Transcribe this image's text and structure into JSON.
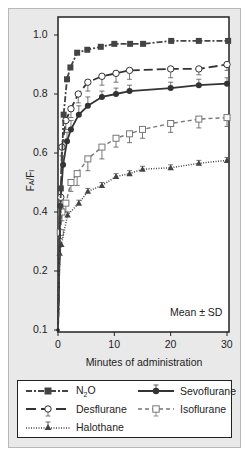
{
  "chart_data": {
    "type": "line",
    "title": "",
    "xlabel": "Minutes of administration",
    "ylabel": "FA/FI",
    "xlim": [
      0,
      30
    ],
    "ylim": [
      0.1,
      1.0
    ],
    "x_ticks": [
      0,
      10,
      20,
      30
    ],
    "x_tick_labels": [
      "0",
      "10",
      "20",
      "30"
    ],
    "y_ticks": [
      0.1,
      0.2,
      0.4,
      0.6,
      0.8,
      1.0
    ],
    "y_tick_labels": [
      "0.1",
      "0.2",
      "0.4",
      "0.6",
      "0.8",
      "1.0"
    ],
    "grid": false,
    "legend_position": "bottom (boxed, below plot)",
    "annotation": "Mean ± SD",
    "series": [
      {
        "name": "N2O",
        "marker": "filled-square",
        "line": "dash-dot",
        "x": [
          0,
          0.5,
          1,
          1.6,
          2.2,
          3.4,
          5.2,
          7.6,
          10,
          12.8,
          15.1,
          20.1,
          25,
          30.2
        ],
        "values": [
          0.1,
          0.48,
          0.73,
          0.85,
          0.89,
          0.94,
          0.95,
          0.96,
          0.97,
          0.97,
          0.97,
          0.98,
          0.98,
          0.98
        ],
        "sd": []
      },
      {
        "name": "Desflurane",
        "marker": "open-circle",
        "line": "long-dash",
        "x": [
          0,
          0.5,
          0.7,
          1.4,
          2.3,
          3.6,
          5.3,
          7.8,
          10.3,
          12.7,
          20,
          25,
          30
        ],
        "values": [
          0.1,
          0.45,
          0.62,
          0.71,
          0.75,
          0.8,
          0.84,
          0.86,
          0.87,
          0.88,
          0.885,
          0.885,
          0.9
        ],
        "sd": [
          0,
          0.03,
          0.03,
          0.03,
          0.03,
          0.03,
          0.03,
          0.03,
          0.03,
          0.03,
          0.03,
          0.02,
          0.02
        ]
      },
      {
        "name": "Sevoflurane",
        "marker": "filled-circle",
        "line": "solid",
        "x": [
          0,
          0.4,
          0.9,
          1.6,
          2.3,
          3.7,
          5.3,
          7.8,
          10.3,
          12.7,
          20,
          25,
          30
        ],
        "values": [
          0.1,
          0.42,
          0.56,
          0.64,
          0.68,
          0.73,
          0.76,
          0.79,
          0.8,
          0.81,
          0.82,
          0.83,
          0.835
        ],
        "sd": [
          0,
          0.03,
          0.03,
          0.03,
          0.03,
          0.03,
          0.03,
          0.02,
          0.02,
          0.02,
          0.02,
          0.02,
          0.02
        ]
      },
      {
        "name": "Isoflurane",
        "marker": "open-square",
        "line": "short-dash",
        "x": [
          0,
          0.4,
          0.7,
          1.4,
          2.3,
          3.4,
          5.3,
          7.8,
          10.3,
          12.7,
          15,
          20,
          25,
          30
        ],
        "values": [
          0.1,
          0.33,
          0.4,
          0.43,
          0.5,
          0.53,
          0.58,
          0.62,
          0.65,
          0.665,
          0.68,
          0.7,
          0.715,
          0.72
        ],
        "sd": [
          0,
          0.02,
          0.03,
          0.03,
          0.03,
          0.04,
          0.04,
          0.04,
          0.03,
          0.03,
          0.03,
          0.03,
          0.03,
          0.03
        ]
      },
      {
        "name": "Halothane",
        "marker": "filled-triangle",
        "line": "dotted",
        "x": [
          0,
          0.3,
          0.6,
          1.7,
          3.7,
          5.3,
          7.8,
          10.3,
          12.7,
          15,
          20,
          25,
          30
        ],
        "values": [
          0.1,
          0.26,
          0.29,
          0.39,
          0.43,
          0.47,
          0.49,
          0.52,
          0.53,
          0.545,
          0.55,
          0.565,
          0.575
        ],
        "sd": [
          0,
          0,
          0,
          0.01,
          0.01,
          0.01,
          0.01,
          0.01,
          0.01,
          0.01,
          0.01,
          0.01,
          0.01
        ]
      }
    ]
  },
  "axes": {
    "x_title": "Minutes of administration",
    "y_title": "FA/FI",
    "annotation": "Mean ± SD"
  },
  "legend": {
    "items": [
      {
        "label": "N2O",
        "label_main": "N",
        "label_sub": "2",
        "label_rest": "O"
      },
      {
        "label": "Sevoflurane"
      },
      {
        "label": "Desflurane"
      },
      {
        "label": "Isoflurane"
      },
      {
        "label": "Halothane"
      }
    ]
  }
}
